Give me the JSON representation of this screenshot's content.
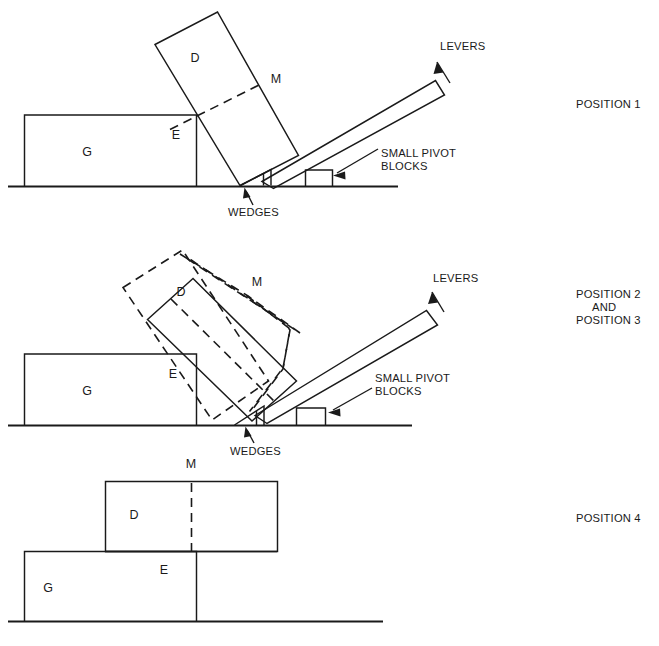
{
  "figure": {
    "background_color": "#ffffff",
    "line_color": "#1a1a1a",
    "width": 659,
    "height": 646
  },
  "diagrams": [
    {
      "id": "position-1",
      "position_label": "POSITION 1",
      "part_labels": {
        "block_d": "D",
        "block_g": "G",
        "edge_e": "E",
        "line_m": "M"
      },
      "callouts": {
        "levers": "LEVERS",
        "pivot_blocks_line1": "SMALL PIVOT",
        "pivot_blocks_line2": "BLOCKS",
        "wedges": "WEDGES"
      }
    },
    {
      "id": "position-2-and-3",
      "position_label_line1": "POSITION 2",
      "position_label_line2": "AND",
      "position_label_line3": "POSITION 3",
      "part_labels": {
        "block_d": "D",
        "block_g": "G",
        "edge_e": "E",
        "line_m": "M"
      },
      "callouts": {
        "levers": "LEVERS",
        "pivot_blocks_line1": "SMALL PIVOT",
        "pivot_blocks_line2": "BLOCKS",
        "wedges": "WEDGES"
      }
    },
    {
      "id": "position-4",
      "position_label": "POSITION 4",
      "part_labels": {
        "block_d": "D",
        "block_g": "G",
        "edge_e": "E",
        "line_m": "M"
      }
    }
  ]
}
